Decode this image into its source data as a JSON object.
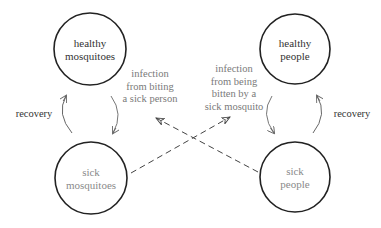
{
  "nodes": {
    "healthy_mosquitoes": {
      "line1": "healthy",
      "line2": "mosquitoes"
    },
    "sick_mosquitoes": {
      "line1": "sick",
      "line2": "mosquitoes"
    },
    "healthy_people": {
      "line1": "healthy",
      "line2": "people"
    },
    "sick_people": {
      "line1": "sick",
      "line2": "people"
    }
  },
  "edges": {
    "mosquito_recovery": {
      "label": "recovery"
    },
    "people_recovery": {
      "label": "recovery"
    },
    "mosquito_infection": {
      "lines": [
        "infection",
        "from biting",
        "a sick person"
      ]
    },
    "people_infection": {
      "lines": [
        "infection",
        "from being",
        "bitten by a",
        "sick mosquito"
      ]
    }
  },
  "colors": {
    "stroke": "#222222",
    "arrow_gray": "#777777",
    "text_dark": "#333333",
    "text_gray": "#8a8a8a"
  }
}
